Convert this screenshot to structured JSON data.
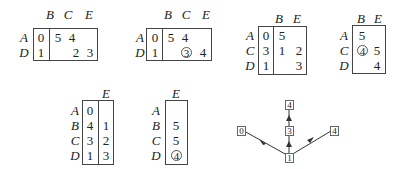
{
  "tables": [
    {
      "cols": [
        "B",
        "C",
        "E"
      ],
      "rows": [
        {
          "label": "A",
          "first": "0",
          "cells": [
            "5",
            "4",
            ""
          ]
        },
        {
          "label": "D",
          "first": "1",
          "cells": [
            "",
            "2",
            "3"
          ]
        }
      ]
    },
    {
      "cols": [
        "B",
        "C",
        "E"
      ],
      "rows": [
        {
          "label": "A",
          "first": "0",
          "cells": [
            "5",
            "4",
            ""
          ]
        },
        {
          "label": "D",
          "first": "1",
          "cells": [
            "",
            "3",
            "4"
          ]
        }
      ],
      "circled": "3"
    },
    {
      "cols": [
        "B",
        "E"
      ],
      "rows": [
        {
          "label": "A",
          "first": "0",
          "cells": [
            "5",
            ""
          ]
        },
        {
          "label": "C",
          "first": "3",
          "cells": [
            "1",
            "2"
          ]
        },
        {
          "label": "D",
          "first": "1",
          "cells": [
            "",
            "3"
          ]
        }
      ]
    },
    {
      "cols": [
        "B",
        "E"
      ],
      "rows": [
        {
          "label": "A",
          "cells": [
            "5",
            ""
          ]
        },
        {
          "label": "C",
          "cells": [
            "4",
            "5"
          ]
        },
        {
          "label": "D",
          "cells": [
            "",
            "4"
          ]
        }
      ],
      "circled": "4"
    },
    {
      "cols": [
        "E"
      ],
      "rows": [
        {
          "label": "A",
          "first": "0",
          "cells": [
            ""
          ]
        },
        {
          "label": "B",
          "first": "4",
          "cells": [
            "1"
          ]
        },
        {
          "label": "C",
          "first": "3",
          "cells": [
            "2"
          ]
        },
        {
          "label": "D",
          "first": "1",
          "cells": [
            "3"
          ]
        }
      ]
    },
    {
      "cols": [
        "E"
      ],
      "rows": [
        {
          "label": "A",
          "cells": [
            ""
          ]
        },
        {
          "label": "B",
          "cells": [
            "5"
          ]
        },
        {
          "label": "C",
          "cells": [
            "5"
          ]
        },
        {
          "label": "D",
          "cells": [
            "4"
          ]
        }
      ],
      "circled": "4"
    }
  ],
  "graph": {
    "nodes": {
      "left": "0",
      "center": "1",
      "mid": "3",
      "top": "4",
      "right": "4"
    }
  }
}
